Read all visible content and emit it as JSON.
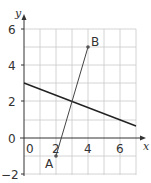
{
  "diagram": {
    "type": "coordinate-grid",
    "axes": {
      "x_label": "x",
      "y_label": "y",
      "x_range": [
        0,
        7
      ],
      "y_range": [
        -2,
        6
      ],
      "x_ticks": [
        "0",
        "2",
        "4",
        "6"
      ],
      "y_ticks": [
        "6",
        "4",
        "2",
        "0",
        "−2"
      ]
    },
    "points": [
      {
        "label": "A",
        "x": 2,
        "y": -1
      },
      {
        "label": "B",
        "x": 4,
        "y": 5
      }
    ],
    "lines": [
      {
        "name": "segment-AB",
        "from": [
          2,
          -1
        ],
        "to": [
          4,
          5
        ]
      },
      {
        "name": "line-1",
        "from": [
          0,
          3
        ],
        "to": [
          7,
          0.67
        ]
      }
    ],
    "intersection": {
      "x": 3,
      "y": 2
    }
  }
}
